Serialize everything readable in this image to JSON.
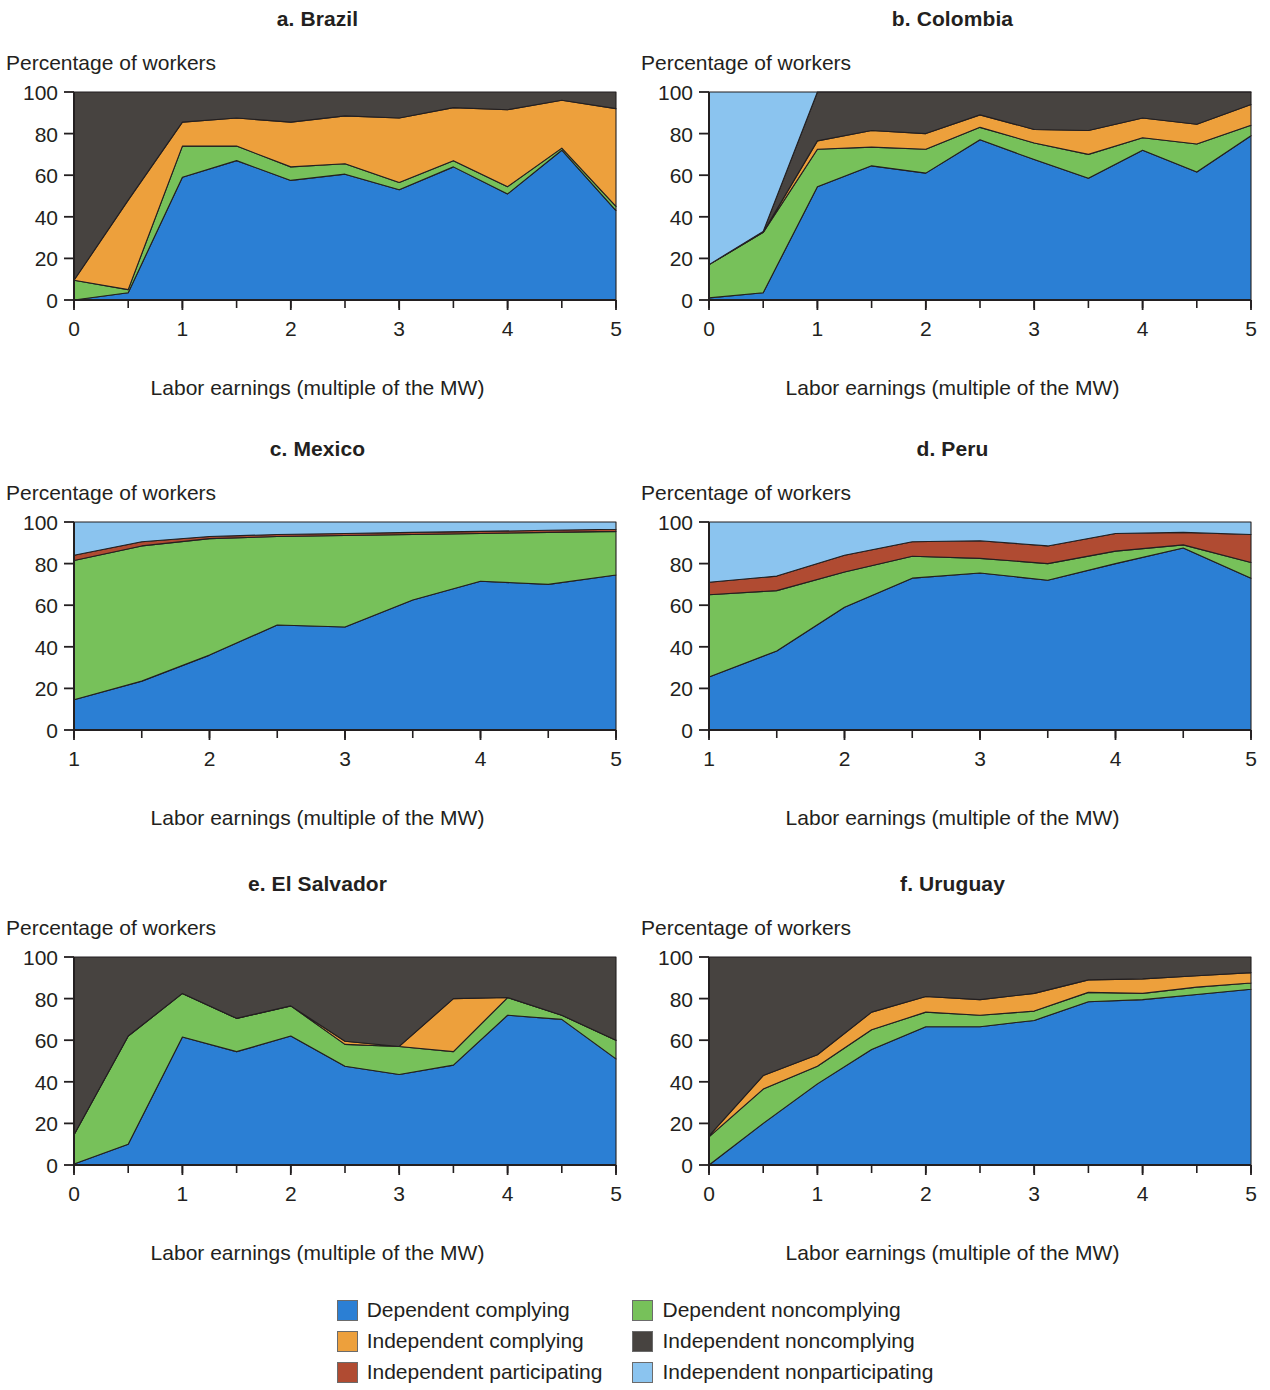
{
  "figure": {
    "y_axis_title": "Percentage of workers",
    "x_axis_title": "Labor earnings (multiple of the MW)"
  },
  "legend": {
    "items": [
      {
        "label": "Dependent complying",
        "color": "#2b7fd4",
        "key": "dependent_complying"
      },
      {
        "label": "Dependent noncomplying",
        "color": "#77c15a",
        "key": "dependent_noncomplying"
      },
      {
        "label": "Independent complying",
        "color": "#eda03c",
        "key": "independent_complying"
      },
      {
        "label": "Independent noncomplying",
        "color": "#474340",
        "key": "independent_noncomplying"
      },
      {
        "label": "Independent participating",
        "color": "#b04b32",
        "key": "independent_participating"
      },
      {
        "label": "Independent nonparticipating",
        "color": "#8bc4ef",
        "key": "independent_nonparticipating"
      }
    ]
  },
  "chart_data": [
    {
      "type": "area",
      "title": "a. Brazil",
      "panel": "a",
      "xlabel": "Labor earnings (multiple of the MW)",
      "ylabel": "Percentage of workers",
      "xlim": [
        0,
        5
      ],
      "ylim": [
        0,
        100
      ],
      "xticks": [
        0,
        1,
        2,
        3,
        4,
        5
      ],
      "xtick_labels": [
        "0",
        "1",
        "2",
        "3",
        "4",
        "5"
      ],
      "yticks": [
        0,
        20,
        40,
        60,
        80,
        100
      ],
      "ytick_labels": [
        "0",
        "20",
        "40",
        "60",
        "80",
        "100"
      ],
      "minor_xtick_step": 0.5,
      "grid": false,
      "stacked": true,
      "x": [
        0,
        0.5,
        1,
        1.5,
        2,
        2.5,
        3,
        3.5,
        4,
        4.5,
        5
      ],
      "series": [
        {
          "name": "Dependent complying",
          "color": "#2b7fd4",
          "values": [
            0,
            3.5,
            59,
            67,
            57.5,
            60.5,
            53,
            64,
            51,
            72,
            43
          ]
        },
        {
          "name": "Dependent noncomplying",
          "color": "#77c15a",
          "values": [
            9.5,
            1.5,
            15,
            7,
            6.5,
            5,
            3.5,
            3,
            3.5,
            1,
            2
          ]
        },
        {
          "name": "Independent complying",
          "color": "#eda03c",
          "values": [
            0,
            43,
            11.5,
            13.5,
            21.5,
            23,
            31,
            25.5,
            37,
            23,
            47
          ]
        },
        {
          "name": "Independent noncomplying",
          "color": "#474340",
          "values": [
            90.5,
            52,
            14.5,
            12.5,
            14.5,
            11.5,
            12.5,
            7.5,
            8.5,
            4,
            8
          ]
        }
      ],
      "cumulative_tops": {
        "dependent_complying": [
          0,
          3.5,
          59,
          67,
          57.5,
          60.5,
          53,
          64,
          51,
          72,
          43
        ],
        "dependent_noncomplying": [
          9.5,
          5,
          74,
          74,
          64,
          65.5,
          56.5,
          67,
          54.5,
          73,
          45
        ],
        "independent_complying": [
          9.5,
          48,
          85.5,
          87.5,
          85.5,
          88.5,
          87.5,
          92.5,
          91.5,
          96,
          92
        ],
        "independent_noncomplying": [
          100,
          100,
          100,
          100,
          100,
          100,
          100,
          100,
          100,
          100,
          100
        ]
      }
    },
    {
      "type": "area",
      "title": "b. Colombia",
      "panel": "b",
      "xlabel": "Labor earnings (multiple of the MW)",
      "ylabel": "Percentage of workers",
      "xlim": [
        0,
        5
      ],
      "ylim": [
        0,
        100
      ],
      "xticks": [
        0,
        1,
        2,
        3,
        4,
        5
      ],
      "xtick_labels": [
        "0",
        "1",
        "2",
        "3",
        "4",
        "5"
      ],
      "yticks": [
        0,
        20,
        40,
        60,
        80,
        100
      ],
      "ytick_labels": [
        "0",
        "20",
        "40",
        "60",
        "80",
        "100"
      ],
      "minor_xtick_step": 0.5,
      "grid": false,
      "stacked": true,
      "x": [
        0,
        0.5,
        1,
        1.5,
        2,
        2.5,
        3,
        3.5,
        4,
        4.5,
        5
      ],
      "series": [
        {
          "name": "Dependent complying",
          "color": "#2b7fd4",
          "values": [
            1,
            3.5,
            54.5,
            64.5,
            61,
            77,
            67.5,
            58.5,
            72,
            61.5,
            79
          ]
        },
        {
          "name": "Dependent noncomplying",
          "color": "#77c15a",
          "values": [
            16,
            29,
            18,
            9,
            11.5,
            6,
            8,
            11.5,
            6,
            13.5,
            5
          ]
        },
        {
          "name": "Independent complying",
          "color": "#eda03c",
          "values": [
            0,
            0,
            4,
            8,
            7.5,
            6,
            6.5,
            11.5,
            9.5,
            9.5,
            10
          ]
        },
        {
          "name": "Independent noncomplying",
          "color": "#474340",
          "values": [
            0,
            0.5,
            23.5,
            18.5,
            20,
            11,
            18,
            18.5,
            12.5,
            15.5,
            6
          ]
        },
        {
          "name": "Independent nonparticipating",
          "color": "#8bc4ef",
          "values": [
            83,
            67,
            0,
            0,
            0,
            0,
            0,
            0,
            0,
            0,
            0
          ]
        }
      ],
      "cumulative_tops": {
        "dependent_complying": [
          1,
          3.5,
          54.5,
          64.5,
          61,
          77,
          67.5,
          58.5,
          72,
          61.5,
          79
        ],
        "dependent_noncomplying": [
          17,
          32.5,
          72.5,
          73.5,
          72.5,
          83,
          75.5,
          70,
          78,
          75,
          84
        ],
        "independent_complying": [
          17,
          32.5,
          76.5,
          81.5,
          80,
          89,
          82,
          81.5,
          87.5,
          84.5,
          94
        ],
        "independent_noncomplying": [
          17,
          33,
          100,
          100,
          100,
          100,
          100,
          100,
          100,
          100,
          100
        ],
        "independent_nonparticipating": [
          100,
          100,
          100,
          100,
          100,
          100,
          100,
          100,
          100,
          100,
          100
        ]
      }
    },
    {
      "type": "area",
      "title": "c. Mexico",
      "panel": "c",
      "xlabel": "Labor earnings (multiple of the MW)",
      "ylabel": "Percentage of workers",
      "xlim": [
        1,
        5
      ],
      "ylim": [
        0,
        100
      ],
      "xticks": [
        1,
        2,
        3,
        4,
        5
      ],
      "xtick_labels": [
        "1",
        "2",
        "3",
        "4",
        "5"
      ],
      "yticks": [
        0,
        20,
        40,
        60,
        80,
        100
      ],
      "ytick_labels": [
        "0",
        "20",
        "40",
        "60",
        "80",
        "100"
      ],
      "minor_xtick_step": 0.5,
      "grid": false,
      "stacked": true,
      "x": [
        1,
        1.5,
        2,
        2.5,
        3,
        3.5,
        4,
        4.5,
        5
      ],
      "series": [
        {
          "name": "Dependent complying",
          "color": "#2b7fd4",
          "values": [
            14.5,
            23.5,
            36,
            50.5,
            49.5,
            62.5,
            71.5,
            70,
            74.5
          ]
        },
        {
          "name": "Dependent noncomplying",
          "color": "#77c15a",
          "values": [
            67,
            65,
            56,
            42.5,
            44,
            31.5,
            23,
            25,
            21
          ]
        },
        {
          "name": "Independent participating",
          "color": "#b04b32",
          "values": [
            2.5,
            2,
            1,
            1,
            1,
            1,
            1,
            1,
            1
          ]
        },
        {
          "name": "Independent nonparticipating",
          "color": "#8bc4ef",
          "values": [
            16,
            9.5,
            7,
            6,
            5.5,
            5,
            4.5,
            4,
            3.5
          ]
        }
      ],
      "cumulative_tops": {
        "dependent_complying": [
          14.5,
          23.5,
          36,
          50.5,
          49.5,
          62.5,
          71.5,
          70,
          74.5
        ],
        "dependent_noncomplying": [
          81.5,
          88.5,
          92,
          93,
          93.5,
          94,
          94.5,
          95,
          95.5
        ],
        "independent_participating": [
          84,
          90.5,
          93,
          94,
          94.5,
          95,
          95.5,
          96,
          96.5
        ],
        "independent_nonparticipating": [
          100,
          100,
          100,
          100,
          100,
          100,
          100,
          100,
          100
        ]
      }
    },
    {
      "type": "area",
      "title": "d. Peru",
      "panel": "d",
      "xlabel": "Labor earnings (multiple of the MW)",
      "ylabel": "Percentage of workers",
      "xlim": [
        1,
        5
      ],
      "ylim": [
        0,
        100
      ],
      "xticks": [
        1,
        2,
        3,
        4,
        5
      ],
      "xtick_labels": [
        "1",
        "2",
        "3",
        "4",
        "5"
      ],
      "yticks": [
        0,
        20,
        40,
        60,
        80,
        100
      ],
      "ytick_labels": [
        "0",
        "20",
        "40",
        "60",
        "80",
        "100"
      ],
      "minor_xtick_step": 0.5,
      "grid": false,
      "stacked": true,
      "x": [
        1,
        1.5,
        2,
        2.5,
        3,
        3.5,
        4,
        4.5,
        5
      ],
      "series": [
        {
          "name": "Dependent complying",
          "color": "#2b7fd4",
          "values": [
            25.5,
            38,
            59,
            73,
            75.5,
            72,
            80,
            87.5,
            73
          ]
        },
        {
          "name": "Dependent noncomplying",
          "color": "#77c15a",
          "values": [
            39.5,
            29,
            17,
            10.5,
            7,
            8,
            6,
            1.5,
            7.5
          ]
        },
        {
          "name": "Independent participating",
          "color": "#b04b32",
          "values": [
            6,
            7,
            8,
            7,
            8.5,
            8.5,
            8.5,
            6,
            13.5
          ]
        },
        {
          "name": "Independent nonparticipating",
          "color": "#8bc4ef",
          "values": [
            29,
            26,
            16,
            9.5,
            9,
            11.5,
            5.5,
            5,
            6
          ]
        }
      ],
      "cumulative_tops": {
        "dependent_complying": [
          25.5,
          38,
          59,
          73,
          75.5,
          72,
          80,
          87.5,
          73
        ],
        "dependent_noncomplying": [
          65,
          67,
          76,
          83.5,
          82.5,
          80,
          86,
          89,
          80.5
        ],
        "independent_participating": [
          71,
          74,
          84,
          90.5,
          91,
          88.5,
          94.5,
          95,
          94
        ],
        "independent_nonparticipating": [
          100,
          100,
          100,
          100,
          100,
          100,
          100,
          100,
          100
        ]
      }
    },
    {
      "type": "area",
      "title": "e. El Salvador",
      "panel": "e",
      "xlabel": "Labor earnings (multiple of the MW)",
      "ylabel": "Percentage of workers",
      "xlim": [
        0,
        5
      ],
      "ylim": [
        0,
        100
      ],
      "xticks": [
        0,
        1,
        2,
        3,
        4,
        5
      ],
      "xtick_labels": [
        "0",
        "1",
        "2",
        "3",
        "4",
        "5"
      ],
      "yticks": [
        0,
        20,
        40,
        60,
        80,
        100
      ],
      "ytick_labels": [
        "0",
        "20",
        "40",
        "60",
        "80",
        "100"
      ],
      "minor_xtick_step": 0.5,
      "grid": false,
      "stacked": true,
      "x": [
        0,
        0.5,
        1,
        1.5,
        2,
        2.5,
        3,
        3.5,
        4,
        4.5,
        5
      ],
      "series": [
        {
          "name": "Dependent complying",
          "color": "#2b7fd4",
          "values": [
            0.5,
            10,
            61.5,
            54.5,
            62,
            47.5,
            43.5,
            48,
            72,
            70,
            51
          ]
        },
        {
          "name": "Dependent noncomplying",
          "color": "#77c15a",
          "values": [
            14,
            52,
            21,
            16,
            14.5,
            10.5,
            13.5,
            6.5,
            8.5,
            2,
            9
          ]
        },
        {
          "name": "Independent complying",
          "color": "#eda03c",
          "values": [
            0,
            0,
            0,
            0,
            0,
            1.5,
            0,
            25.5,
            0,
            0,
            0
          ]
        },
        {
          "name": "Independent noncomplying",
          "color": "#474340",
          "values": [
            85.5,
            38,
            17.5,
            29.5,
            23.5,
            40.5,
            43,
            20,
            19.5,
            28,
            40
          ]
        }
      ],
      "cumulative_tops": {
        "dependent_complying": [
          0.5,
          10,
          61.5,
          54.5,
          62,
          47.5,
          43.5,
          48,
          72,
          70,
          51
        ],
        "dependent_noncomplying": [
          14.5,
          62,
          82.5,
          70.5,
          76.5,
          58,
          57,
          54.5,
          80.5,
          72,
          60
        ],
        "independent_complying": [
          14.5,
          62,
          82.5,
          70.5,
          76.5,
          59.5,
          57,
          80,
          80.5,
          72,
          60
        ],
        "independent_noncomplying": [
          100,
          100,
          100,
          100,
          100,
          100,
          100,
          100,
          100,
          100,
          100
        ]
      }
    },
    {
      "type": "area",
      "title": "f. Uruguay",
      "panel": "f",
      "xlabel": "Labor earnings (multiple of the MW)",
      "ylabel": "Percentage of workers",
      "xlim": [
        0,
        5
      ],
      "ylim": [
        0,
        100
      ],
      "xticks": [
        0,
        1,
        2,
        3,
        4,
        5
      ],
      "xtick_labels": [
        "0",
        "1",
        "2",
        "3",
        "4",
        "5"
      ],
      "yticks": [
        0,
        20,
        40,
        60,
        80,
        100
      ],
      "ytick_labels": [
        "0",
        "20",
        "40",
        "60",
        "80",
        "100"
      ],
      "minor_xtick_step": 0.5,
      "grid": false,
      "stacked": true,
      "x": [
        0,
        0.5,
        1,
        1.5,
        2,
        2.5,
        3,
        3.5,
        4,
        4.5,
        5
      ],
      "series": [
        {
          "name": "Dependent complying",
          "color": "#2b7fd4",
          "values": [
            0,
            20,
            39,
            55.5,
            66.5,
            66.5,
            69.5,
            78.5,
            79.5,
            82,
            84.5
          ]
        },
        {
          "name": "Dependent noncomplying",
          "color": "#77c15a",
          "values": [
            13.5,
            16.5,
            8.5,
            9.5,
            7,
            5.5,
            4.5,
            4.5,
            3,
            3.5,
            3
          ]
        },
        {
          "name": "Independent complying",
          "color": "#eda03c",
          "values": [
            0.5,
            6.5,
            5.5,
            8.5,
            7.5,
            7.5,
            8.5,
            6,
            7,
            5.5,
            5
          ]
        },
        {
          "name": "Independent noncomplying",
          "color": "#474340",
          "values": [
            86,
            57,
            47,
            26.5,
            19,
            20.5,
            17.5,
            11,
            10.5,
            9,
            7.5
          ]
        }
      ],
      "cumulative_tops": {
        "dependent_complying": [
          0,
          20,
          39,
          55.5,
          66.5,
          66.5,
          69.5,
          78.5,
          79.5,
          82,
          84.5
        ],
        "dependent_noncomplying": [
          13.5,
          36.5,
          47.5,
          65,
          73.5,
          72,
          74,
          83,
          82.5,
          85.5,
          87.5
        ],
        "independent_complying": [
          14,
          43,
          53,
          73.5,
          81,
          79.5,
          82.5,
          89,
          89.5,
          91,
          92.5
        ],
        "independent_noncomplying": [
          100,
          100,
          100,
          100,
          100,
          100,
          100,
          100,
          100,
          100,
          100
        ]
      }
    }
  ]
}
